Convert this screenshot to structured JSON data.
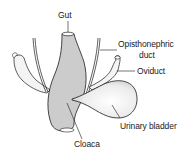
{
  "figure": {
    "type": "anatomical illustration",
    "labels": {
      "gut": "Gut",
      "opisthonephric_duct_line1": "Opisthonephric",
      "opisthonephric_duct_line2": "duct",
      "oviduct": "Oviduct",
      "urinary_bladder": "Urinary bladder",
      "cloaca": "Cloaca"
    },
    "colors": {
      "ink": "#1a1a1a",
      "paper": "#ffffff",
      "shade": "#d9d9d9"
    }
  }
}
